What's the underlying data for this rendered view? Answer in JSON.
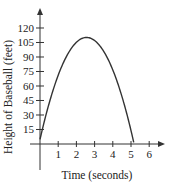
{
  "chart_data": {
    "type": "line",
    "title": "",
    "xlabel": "Time (seconds)",
    "ylabel": "Height of Baseball (feet)",
    "xlim": [
      0,
      6.8
    ],
    "ylim": [
      0,
      130
    ],
    "x_ticks": [
      1,
      2,
      3,
      4,
      5,
      6
    ],
    "y_ticks": [
      15,
      30,
      45,
      60,
      75,
      90,
      105,
      120
    ],
    "grid": false,
    "legend": null,
    "series": [
      {
        "name": "height",
        "x": [
          0,
          0.5,
          1,
          1.5,
          2,
          2.5,
          2.56,
          3,
          3.5,
          4,
          4.5,
          5,
          5.15
        ],
        "y": [
          5,
          42,
          71,
          92,
          105,
          110,
          110,
          107,
          96,
          77,
          50,
          15,
          0
        ]
      }
    ],
    "annotations": []
  },
  "plot": {
    "origin_x": 40,
    "origin_y": 144,
    "px_per_x": 18.2,
    "px_per_y": 0.9667,
    "x_axis_end": 165,
    "y_axis_top": 8,
    "y_axis_bottom": 170,
    "x_axis_left": 30,
    "line_color": "#333333"
  }
}
